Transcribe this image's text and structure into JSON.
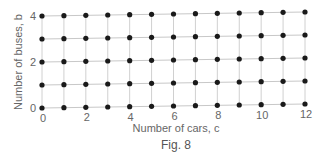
{
  "chart_data": {
    "type": "scatter",
    "title": "",
    "caption": "Fig. 8",
    "xlabel": "Number of cars, c",
    "ylabel": "Number of buses, b",
    "x_ticks": [
      "0",
      "2",
      "4",
      "6",
      "8",
      "10",
      "12"
    ],
    "y_ticks": [
      "0",
      "2",
      "4"
    ],
    "xlim": [
      0,
      12
    ],
    "ylim": [
      0,
      4
    ],
    "grid": true,
    "legend": null,
    "points_description": "All integer lattice points (c, b) with 0 <= c <= 12 and 0 <= b <= 4",
    "x_values": [
      0,
      1,
      2,
      3,
      4,
      5,
      6,
      7,
      8,
      9,
      10,
      11,
      12
    ],
    "y_values": [
      0,
      1,
      2,
      3,
      4
    ],
    "point_count": 65
  }
}
